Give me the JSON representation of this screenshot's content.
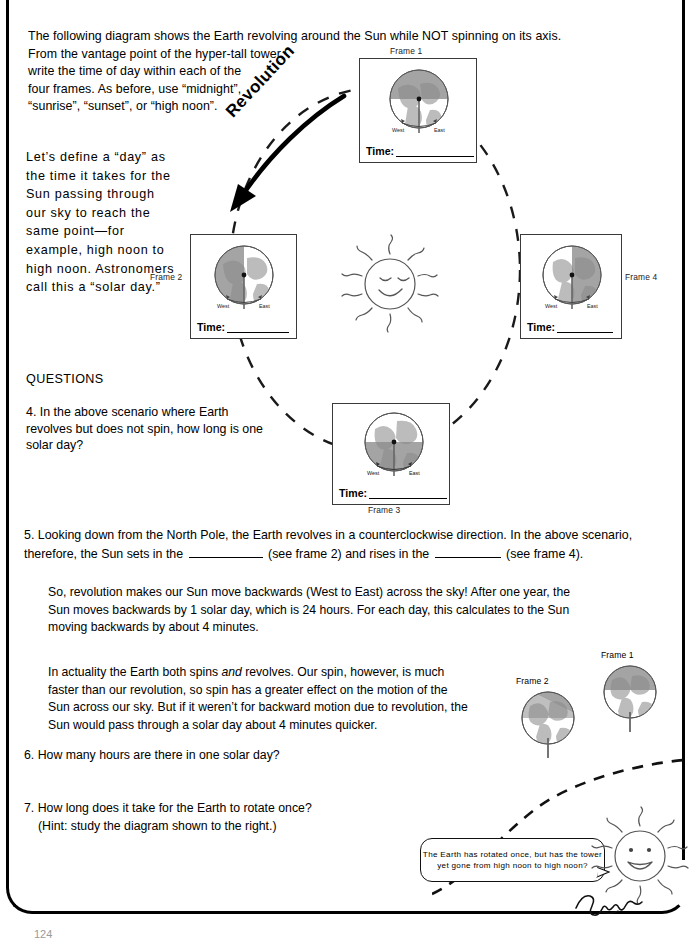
{
  "intro": {
    "line1": "The following diagram shows the Earth revolving around the Sun while NOT spinning on its axis.",
    "line2": "From the vantage point of the hyper-tall tower,",
    "line3": "write the time of day within each of the",
    "line4": "four frames. As before, use “midnight”,",
    "line5": "“sunrise”, “sunset”, or “high noon”."
  },
  "definition": {
    "text": "Let’s define a “day” as the time it takes for the Sun passing through our sky to reach the same point—for example, high noon to high noon. Astronomers call this a “solar day.”"
  },
  "diagram": {
    "revolution_label": "Revolution",
    "sun_icon": "smiling-sun-icon",
    "orbit": "dashed-circle",
    "time_label": "Time:",
    "compass": {
      "west": "West",
      "east": "East"
    },
    "frames": [
      {
        "id": "frame-1",
        "label": "Frame 1",
        "shadow": "top",
        "time_value": ""
      },
      {
        "id": "frame-2",
        "label": "Frame 2",
        "shadow": "left",
        "time_value": ""
      },
      {
        "id": "frame-3",
        "label": "Frame 3",
        "shadow": "bottom",
        "time_value": ""
      },
      {
        "id": "frame-4",
        "label": "Frame 4",
        "shadow": "right",
        "time_value": ""
      }
    ]
  },
  "questions": {
    "heading": "QUESTIONS",
    "q4": "4. In the above scenario where Earth revolves but does not spin, how long is one solar day?",
    "q5_part1": "5. Looking down from the North Pole, the Earth revolves in a counterclockwise direction. In the above scenario, therefore, the Sun sets in the",
    "q5_part2": "(see frame 2) and rises in the",
    "q5_part3": "(see frame 4).",
    "q6": "6. How many hours are there in one solar day?",
    "q7_line1": "7. How long does it take for the Earth to rotate once?",
    "q7_line2": "(Hint: study the diagram shown to the right.)"
  },
  "paragraphs": {
    "p1": "So, revolution makes our Sun move backwards (West to East) across the sky! After one year, the Sun moves backwards by 1 solar day, which is 24 hours. For each day, this calculates to the Sun moving backwards by about 4 minutes.",
    "p2_a": "In actuality the Earth both spins ",
    "p2_em": "and",
    "p2_b": " revolves. Our spin, however, is much faster than our revolution, so spin has a greater effect on the motion of the Sun across our sky. But if it weren’t for backward motion due to revolution, the Sun would pass through a solar day about 4 minutes quicker."
  },
  "bottom_diagram": {
    "frame1_label": "Frame 1",
    "frame2_label": "Frame 2",
    "bubble": "The Earth has rotated once, but has the tower yet gone from high noon to high noon?",
    "sun_icon": "open-mouth-sun-icon",
    "signature": "signature-mark"
  },
  "footer": {
    "page_number": "124"
  },
  "colors": {
    "ink": "#000000",
    "shadow_gray": "#8a8a8a",
    "land_gray": "#b8b8b8",
    "frame_border": "#3a3a3a"
  }
}
